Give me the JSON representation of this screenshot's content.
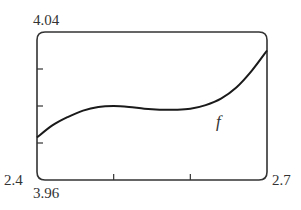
{
  "chart_data": {
    "type": "line",
    "title": "",
    "xlabel": "",
    "ylabel": "",
    "xlim": [
      2.4,
      2.7
    ],
    "ylim": [
      3.96,
      4.04
    ],
    "grid": false,
    "legend": null,
    "x_ticks": [
      2.5,
      2.6
    ],
    "y_ticks": [
      3.98,
      4.0,
      4.02
    ],
    "corner_labels": {
      "x_min": "2.4",
      "x_max": "2.7",
      "y_min": "3.96",
      "y_max": "4.04"
    },
    "series": [
      {
        "name": "f",
        "x": [
          2.4,
          2.42,
          2.44,
          2.46,
          2.48,
          2.5,
          2.52,
          2.54,
          2.56,
          2.58,
          2.6,
          2.62,
          2.64,
          2.66,
          2.68,
          2.7
        ],
        "y": [
          3.983,
          3.9895,
          3.994,
          3.9975,
          3.9995,
          4.0,
          3.9995,
          3.9985,
          3.998,
          3.998,
          3.9985,
          4.0005,
          4.004,
          4.01,
          4.019,
          4.03
        ]
      }
    ],
    "annotations": [
      {
        "text": "f",
        "x": 2.635,
        "y": 3.993
      }
    ]
  }
}
